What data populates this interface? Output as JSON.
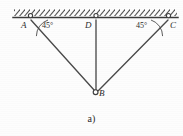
{
  "figure": {
    "caption": "a)",
    "type": "statics-truss-diagram",
    "stroke_color": "#3a3a3a",
    "hatch_color": "#555555",
    "background_color": "#fdfdfd"
  },
  "nodes": [
    {
      "id": "A",
      "label": "A",
      "x": 30,
      "y": 19,
      "support": "pin-on-ceiling"
    },
    {
      "id": "D",
      "label": "D",
      "x": 96,
      "y": 19,
      "support": "pin-on-ceiling"
    },
    {
      "id": "C",
      "label": "C",
      "x": 169,
      "y": 19,
      "support": "pin-on-ceiling"
    },
    {
      "id": "B",
      "label": "B",
      "x": 96,
      "y": 92,
      "support": "free-joint"
    }
  ],
  "members": [
    {
      "from": "A",
      "to": "B"
    },
    {
      "from": "D",
      "to": "B"
    },
    {
      "from": "C",
      "to": "B"
    }
  ],
  "angles": [
    {
      "at": "A",
      "label": "45°",
      "value": 45,
      "between": "ceiling-and-AB"
    },
    {
      "at": "C",
      "label": "45°",
      "value": 45,
      "between": "ceiling-and-CB"
    }
  ],
  "ceiling": {
    "name": "fixed-support-ceiling",
    "y": 17,
    "x_start": 14,
    "x_end": 177,
    "hatching": "diagonal"
  }
}
